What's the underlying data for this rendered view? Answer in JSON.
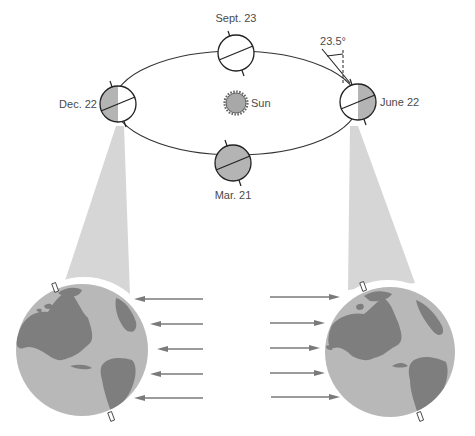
{
  "labels": {
    "sun": "Sun",
    "tilt_angle": "23.5°",
    "positions": [
      {
        "id": "sept",
        "label": "Sept. 23",
        "state": "unlit-view"
      },
      {
        "id": "mar",
        "label": "Mar. 21",
        "state": "shaded-view"
      },
      {
        "id": "dec",
        "label": "Dec. 22",
        "state": "left-half-shaded"
      },
      {
        "id": "june",
        "label": "June 22",
        "state": "right-half-shaded"
      }
    ]
  },
  "enlargements": [
    {
      "id": "dec-globe",
      "source": "Dec. 22",
      "arrow_direction": "left",
      "arrow_count": 5
    },
    {
      "id": "june-globe",
      "source": "June 22",
      "arrow_direction": "right",
      "arrow_count": 5
    }
  ],
  "colors": {
    "shade": "#b4b4b4",
    "land": "#7e7e7e",
    "ocean": "#b8b8b8",
    "cone": "#d6d6d6",
    "arrow": "#7a7a7a",
    "line": "#222222"
  }
}
